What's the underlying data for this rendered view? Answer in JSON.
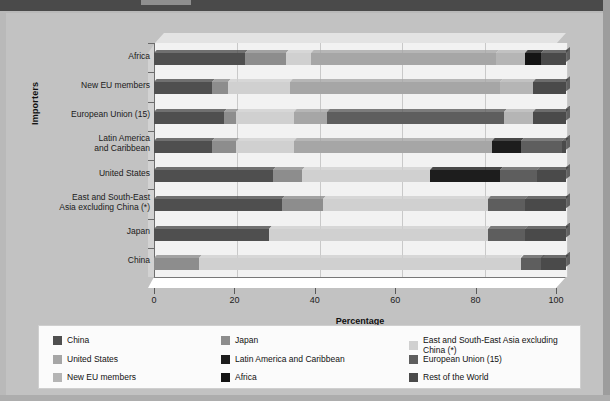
{
  "axis": {
    "y_title": "Importers",
    "x_title": "Percentage",
    "x_ticks": [
      "0",
      "20",
      "40",
      "60",
      "80",
      "100"
    ]
  },
  "legend": {
    "items": [
      {
        "label": "China",
        "color": "#4f4f4f"
      },
      {
        "label": "Japan",
        "color": "#8d8d8d"
      },
      {
        "label": "East and South-East Asia excluding China (*)",
        "color": "#d0d0d0"
      },
      {
        "label": "United States",
        "color": "#a6a6a6"
      },
      {
        "label": "Latin America and Caribbean",
        "color": "#1d1d1d"
      },
      {
        "label": "European Union (15)",
        "color": "#5e5e5e"
      },
      {
        "label": "New EU members",
        "color": "#b5b5b5"
      },
      {
        "label": "Africa",
        "color": "#141414"
      },
      {
        "label": "Rest of the World",
        "color": "#4a4a4a"
      }
    ]
  },
  "chart_data": {
    "type": "bar",
    "orientation": "horizontal",
    "stacked": true,
    "title": "",
    "xlabel": "Percentage",
    "ylabel": "Importers",
    "xlim": [
      0,
      100
    ],
    "grid": true,
    "legend_position": "bottom",
    "categories": [
      "China",
      "Japan",
      "East and South-East\nAsia excluding China (*)",
      "United States",
      "Latin America\nand Caribbean",
      "European Union (15)",
      "New EU members",
      "Africa"
    ],
    "series": [
      {
        "name": "China",
        "color": "#4f4f4f",
        "values": [
          0,
          28,
          31,
          29,
          14,
          17,
          14,
          22
        ]
      },
      {
        "name": "Japan",
        "color": "#8d8d8d",
        "values": [
          11,
          0,
          10,
          7,
          6,
          3,
          4,
          10
        ]
      },
      {
        "name": "East and South-East Asia excluding China (*)",
        "color": "#d0d0d0",
        "values": [
          78,
          53,
          40,
          31,
          14,
          14,
          15,
          6
        ]
      },
      {
        "name": "United States",
        "color": "#a6a6a6",
        "values": [
          0,
          0,
          0,
          0,
          48,
          8,
          51,
          45
        ]
      },
      {
        "name": "Latin America and Caribbean",
        "color": "#1d1d1d",
        "values": [
          0,
          0,
          0,
          17,
          7,
          0,
          0,
          0
        ]
      },
      {
        "name": "European Union (15)",
        "color": "#5e5e5e",
        "values": [
          5,
          9,
          9,
          9,
          10,
          43,
          0,
          0
        ]
      },
      {
        "name": "New EU members",
        "color": "#b5b5b5",
        "values": [
          0,
          0,
          0,
          0,
          0,
          7,
          8,
          7
        ]
      },
      {
        "name": "Africa",
        "color": "#141414",
        "values": [
          0,
          0,
          0,
          0,
          0,
          0,
          0,
          4
        ]
      },
      {
        "name": "Rest of the World",
        "color": "#4a4a4a",
        "values": [
          6,
          10,
          10,
          7,
          1,
          8,
          8,
          6
        ]
      }
    ]
  }
}
